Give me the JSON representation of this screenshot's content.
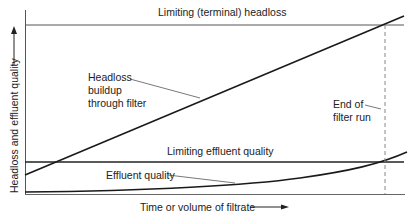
{
  "diagram": {
    "y_axis_label": "Headloss and effluent quality",
    "x_axis_label": "Time or volume of filtrate",
    "labels": {
      "limiting_headloss": "Limiting (terminal) headloss",
      "headloss_line_1": "Headloss",
      "headloss_line_2": "buildup",
      "headloss_line_3": "through filter",
      "end_run_1": "End of",
      "end_run_2": "filter run",
      "limiting_effluent": "Limiting effluent quality",
      "effluent_quality": "Effluent quality"
    },
    "colors": {
      "line": "#1a1a1a",
      "thin_line": "#555555",
      "dashed": "#888888",
      "text": "#222222"
    }
  }
}
